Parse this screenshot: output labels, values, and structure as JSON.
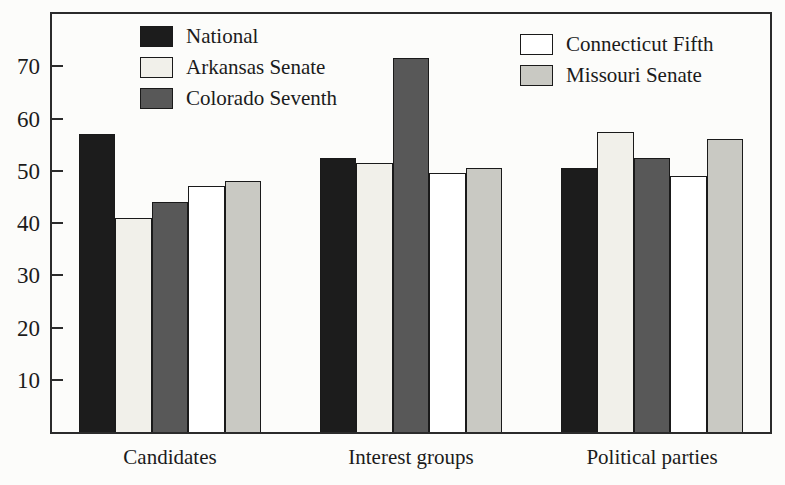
{
  "chart_data": {
    "type": "bar",
    "title": "",
    "xlabel": "",
    "ylabel": "",
    "categories": [
      "Candidates",
      "Interest groups",
      "Political parties"
    ],
    "series": [
      {
        "name": "National",
        "color": "#1c1c1c",
        "values": [
          57,
          52.5,
          50.5
        ]
      },
      {
        "name": "Arkansas Senate",
        "color": "#f1f0ea",
        "values": [
          41,
          51.5,
          57.5
        ]
      },
      {
        "name": "Colorado Seventh",
        "color": "#585858",
        "values": [
          44,
          71.5,
          52.5
        ]
      },
      {
        "name": "Connecticut Fifth",
        "color": "#ffffff",
        "values": [
          47,
          49.5,
          49
        ]
      },
      {
        "name": "Missouri Senate",
        "color": "#c9c9c3",
        "values": [
          48,
          50.5,
          56
        ]
      }
    ],
    "ylim": [
      0,
      80
    ],
    "yticks": [
      10,
      20,
      30,
      40,
      50,
      60,
      70
    ],
    "grid": false,
    "legend_position": "inside-top",
    "legend_split_index": 3,
    "frame_color": "#2b2b2b",
    "background_color": "#fcfcfa"
  }
}
